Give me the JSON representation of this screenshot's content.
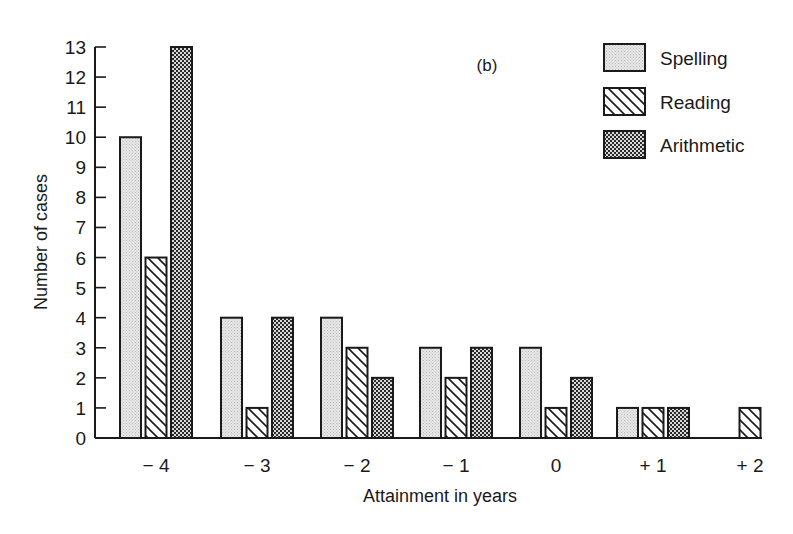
{
  "chart_data": {
    "type": "bar",
    "title": "(b)",
    "xlabel": "Attainment in years",
    "ylabel": "Number of cases",
    "categories": [
      "− 4",
      "− 3",
      "− 2",
      "− 1",
      "0",
      "+ 1",
      "+ 2"
    ],
    "series": [
      {
        "name": "Spelling",
        "pattern": "light-stipple",
        "values": [
          10,
          4,
          4,
          3,
          3,
          1,
          0
        ]
      },
      {
        "name": "Reading",
        "pattern": "diagonal-hatch",
        "values": [
          6,
          1,
          3,
          2,
          1,
          1,
          1
        ]
      },
      {
        "name": "Arithmetic",
        "pattern": "dark-checker",
        "values": [
          13,
          4,
          2,
          3,
          2,
          1,
          0
        ]
      }
    ],
    "ylim": [
      0,
      13
    ],
    "yticks": [
      0,
      1,
      2,
      3,
      4,
      5,
      6,
      7,
      8,
      9,
      10,
      11,
      12,
      13
    ],
    "grid": false,
    "legend_position": "top-right"
  },
  "colors": {
    "ink": "#1a1a1a",
    "stipple": "#dcdcdc",
    "background": "#ffffff"
  }
}
